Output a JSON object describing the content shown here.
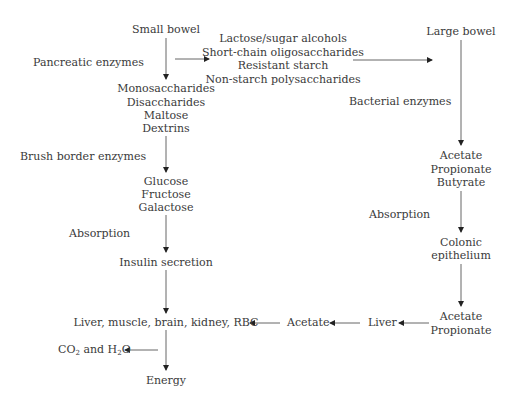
{
  "diagram": {
    "type": "carbohydrate-digestion-flowchart",
    "small_bowel_path": {
      "start": "Small bowel",
      "step1_label": "Pancreatic enzymes",
      "step1_products": [
        "Monosaccharides",
        "Disaccharides",
        "Maltose",
        "Dextrins"
      ],
      "step2_label": "Brush border enzymes",
      "step2_products": [
        "Glucose",
        "Fructose",
        "Galactose"
      ],
      "step3_label": "Absorption",
      "step3_result": "Insulin secretion",
      "targets": "Liver, muscle, brain, kidney, RBC",
      "byproduct_co2": "CO",
      "byproduct_co2_sub": "2",
      "byproduct_and": " and H",
      "byproduct_h2o_sub": "2",
      "byproduct_o": "O",
      "end": "Energy"
    },
    "undigested": [
      "Lactose/sugar alcohols",
      "Short-chain oligosaccharides",
      "Resistant starch",
      "Non-starch polysaccharides"
    ],
    "large_bowel_path": {
      "start": "Large bowel",
      "step1_label": "Bacterial enzymes",
      "step1_products": [
        "Acetate",
        "Propionate",
        "Butyrate"
      ],
      "step2_label": "Absorption",
      "step2_result": [
        "Colonic",
        "epithelium"
      ],
      "step3_products": [
        "Acetate",
        "Propionate"
      ],
      "liver": "Liver",
      "liver_output": "Acetate"
    },
    "arrow_color": "#222222",
    "text_color": "#3a3a3a"
  }
}
